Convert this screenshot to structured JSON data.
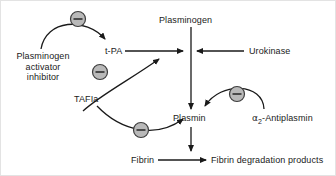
{
  "figure": {
    "kind": "biochemical-pathway-diagram",
    "topic": "fibrinolysis regulation",
    "background_color": "#ffffff",
    "line_color": "#1a1a1a",
    "border_color": "#e3e3e3"
  },
  "nodes": {
    "plasminogen": {
      "label": "Plasminogen",
      "x": 158,
      "y": 14
    },
    "tpa": {
      "label": "t-PA",
      "x": 104,
      "y": 50
    },
    "urokinase": {
      "label": "Urokinase",
      "x": 248,
      "y": 50
    },
    "pai": {
      "label": "Plasminogen activator inhibitor",
      "lines": [
        "Plasminogen",
        "activator",
        "inhibitor"
      ],
      "x": 8,
      "y": 52
    },
    "tafia": {
      "label": "TAFIa",
      "x": 76,
      "y": 97
    },
    "plasmin": {
      "label": "Plasmin",
      "x": 188,
      "y": 116
    },
    "antiplasmin": {
      "label_prefix": "",
      "greek": "α",
      "subscript": "2",
      "label_suffix": "-Antiplasmin",
      "label": "α2-Antiplasmin",
      "x": 253,
      "y": 116
    },
    "fibrin": {
      "label": "Fibrin",
      "x": 133,
      "y": 155
    },
    "fdp": {
      "label": "Fibrin degradation products",
      "x": 210,
      "y": 155
    }
  },
  "inhibition_markers": [
    {
      "name": "minus-marker-pai-to-tpa",
      "symbol": "−",
      "cx": 77,
      "cy": 18,
      "r": 7.5,
      "fill": "#b9b9b9",
      "stroke": "#3d3d3d"
    },
    {
      "name": "minus-marker-pai-to-urokinase",
      "symbol": "−",
      "cx": 99,
      "cy": 71,
      "r": 7.5,
      "fill": "#b9b9b9",
      "stroke": "#3d3d3d"
    },
    {
      "name": "minus-marker-tafia-to-plasmin",
      "symbol": "−",
      "cx": 140,
      "cy": 129,
      "r": 7.5,
      "fill": "#b9b9b9",
      "stroke": "#3d3d3d"
    },
    {
      "name": "minus-marker-antiplasmin-to-plasmin",
      "symbol": "−",
      "cx": 236,
      "cy": 93,
      "r": 7.5,
      "fill": "#b9b9b9",
      "stroke": "#3d3d3d"
    }
  ],
  "edges": [
    {
      "name": "edge-pai-to-tpa",
      "from": "plasminogen-activator-inhibitor",
      "to": "t-PA",
      "style": "curved-arrow",
      "relation": "inhibits"
    },
    {
      "name": "edge-pai-to-urokinase",
      "from": "plasminogen-activator-inhibitor",
      "to": "urokinase-arrow",
      "style": "curved-arrow",
      "relation": "inhibits"
    },
    {
      "name": "edge-tpa-to-plasminogen",
      "from": "t-PA",
      "to": "plasminogen-conversion",
      "style": "straight-arrow",
      "relation": "activates"
    },
    {
      "name": "edge-urokinase-to-plasminogen",
      "from": "Urokinase",
      "to": "plasminogen-conversion",
      "style": "straight-arrow",
      "relation": "activates"
    },
    {
      "name": "edge-plasminogen-to-plasmin",
      "from": "Plasminogen",
      "to": "Plasmin",
      "style": "straight-arrow",
      "relation": "converts-to"
    },
    {
      "name": "edge-tafia-to-plasmin",
      "from": "TAFIa",
      "to": "Plasmin",
      "style": "curved-arrow",
      "relation": "inhibits"
    },
    {
      "name": "edge-antiplasmin-to-plasmin",
      "from": "a2-Antiplasmin",
      "to": "Plasmin",
      "style": "curved-arrow",
      "relation": "inhibits"
    },
    {
      "name": "edge-plasmin-to-fibrinolysis",
      "from": "Plasmin",
      "to": "fibrin-degradation-arrow",
      "style": "straight-arrow",
      "relation": "catalyzes"
    },
    {
      "name": "edge-fibrin-to-fdp",
      "from": "Fibrin",
      "to": "Fibrin degradation products",
      "style": "straight-arrow",
      "relation": "degrades-to"
    }
  ]
}
